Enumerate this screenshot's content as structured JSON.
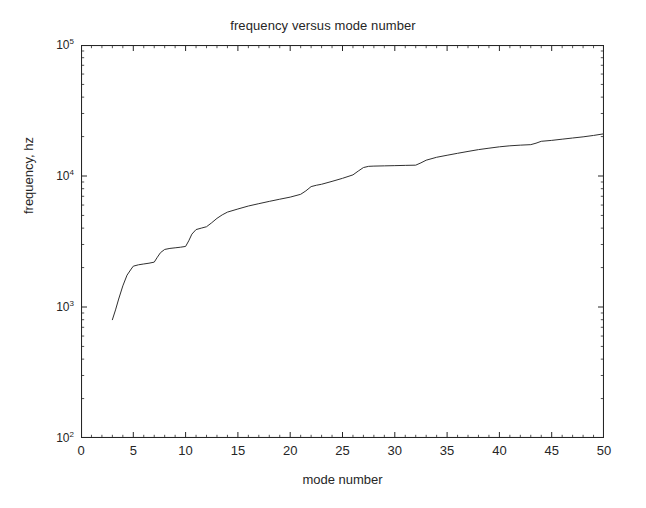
{
  "chart_data": {
    "type": "line",
    "title": "frequency versus mode number",
    "xlabel": "mode number",
    "ylabel": "frequency, hz",
    "xscale": "linear",
    "yscale": "log",
    "xlim": [
      0,
      50
    ],
    "ylim": [
      100,
      100000
    ],
    "xticks": [
      0,
      5,
      10,
      15,
      20,
      25,
      30,
      35,
      40,
      45,
      50
    ],
    "xtick_labels": [
      "0",
      "5",
      "10",
      "15",
      "20",
      "25",
      "30",
      "35",
      "40",
      "45",
      "50"
    ],
    "yticks": [
      100,
      1000,
      10000,
      100000
    ],
    "ytick_labels": [
      "10",
      "10",
      "10",
      "10"
    ],
    "ytick_exponents": [
      "2",
      "3",
      "4",
      "5"
    ],
    "grid": false,
    "legend": null,
    "line_color": "#303030",
    "line_width": 1,
    "minor_ticks": true,
    "tick_direction": "in",
    "box": true,
    "series": [
      {
        "name": "frequency",
        "x": [
          3,
          3.3,
          3.6,
          4,
          4.4,
          4.8,
          5,
          5.5,
          6,
          6.5,
          7,
          7.3,
          7.6,
          8,
          8.5,
          9,
          9.5,
          10,
          10.3,
          10.6,
          11,
          11.5,
          12,
          12.5,
          13,
          13.5,
          14,
          15,
          16,
          17,
          18,
          19,
          20,
          21,
          21.5,
          22,
          22.5,
          23,
          24,
          25,
          26,
          26.5,
          27,
          27.5,
          28,
          29,
          30,
          31,
          32,
          32.5,
          33,
          34,
          35,
          36,
          37,
          38,
          39,
          40,
          41,
          42,
          43,
          43.5,
          44,
          45,
          46,
          47,
          48,
          49,
          50
        ],
        "y": [
          800,
          950,
          1150,
          1450,
          1750,
          1950,
          2050,
          2100,
          2130,
          2160,
          2200,
          2400,
          2600,
          2750,
          2800,
          2830,
          2860,
          2900,
          3200,
          3600,
          3900,
          4000,
          4100,
          4400,
          4750,
          5050,
          5300,
          5600,
          5900,
          6150,
          6400,
          6650,
          6900,
          7250,
          7700,
          8300,
          8500,
          8650,
          9100,
          9600,
          10200,
          10900,
          11600,
          11850,
          11900,
          11950,
          12000,
          12050,
          12100,
          12600,
          13200,
          13900,
          14400,
          14900,
          15400,
          15900,
          16300,
          16700,
          17000,
          17200,
          17350,
          17800,
          18400,
          18700,
          19100,
          19500,
          19900,
          20400,
          21000
        ]
      }
    ]
  },
  "figure": {
    "background_color": "#ffffff",
    "axis_color": "#262626"
  }
}
